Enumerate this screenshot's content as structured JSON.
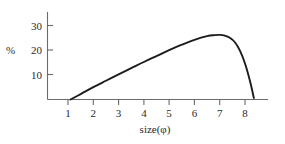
{
  "chart_data": {
    "type": "line",
    "title": "",
    "subtitle": "",
    "xlabel": "size(φ)",
    "ylabel": "%",
    "xlim": [
      0.1,
      8.9
    ],
    "ylim": [
      0,
      34
    ],
    "xticks": [
      "1",
      "2",
      "3",
      "4",
      "5",
      "6",
      "7",
      "8"
    ],
    "xtick_values": [
      1,
      2,
      3,
      4,
      5,
      6,
      7,
      8
    ],
    "yticks": [
      "10",
      "20",
      "30"
    ],
    "ytick_values": [
      10,
      20,
      30
    ],
    "grid": false,
    "legend": null,
    "series": [
      {
        "name": "grain size distribution",
        "x": [
          1.1,
          1.5,
          2.0,
          2.5,
          3.0,
          3.5,
          4.0,
          4.5,
          5.0,
          5.5,
          6.0,
          6.5,
          6.8,
          7.0,
          7.2,
          7.4,
          7.6,
          7.8,
          8.0,
          8.2,
          8.35
        ],
        "y": [
          0.0,
          2.2,
          5.0,
          7.6,
          10.2,
          12.7,
          15.2,
          17.6,
          20.0,
          22.2,
          24.2,
          25.7,
          26.1,
          26.2,
          25.9,
          25.0,
          23.2,
          19.8,
          14.6,
          7.4,
          0.6
        ]
      }
    ],
    "annotations": [],
    "colors": {
      "curve": "#1c1c1c",
      "axis": "#6b6b6b",
      "text": "#2a2a2a",
      "background": "#ffffff"
    }
  },
  "labels": {
    "xtick_1": "1",
    "xtick_2": "2",
    "xtick_3": "3",
    "xtick_4": "4",
    "xtick_5": "5",
    "xtick_6": "6",
    "xtick_7": "7",
    "xtick_8": "8",
    "ytick_10": "10",
    "ytick_20": "20",
    "ytick_30": "30",
    "y_axis_title": "%",
    "x_axis_title": "size(φ)"
  }
}
